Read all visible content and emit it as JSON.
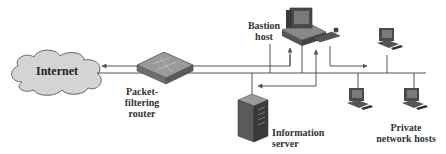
{
  "diagram": {
    "type": "network topology",
    "nodes": [
      {
        "id": "internet",
        "label": "Internet",
        "shape": "cloud"
      },
      {
        "id": "router",
        "label_lines": [
          "Packet-",
          "filtering",
          "router"
        ],
        "shape": "router"
      },
      {
        "id": "bastion",
        "label_lines": [
          "Bastion",
          "host"
        ],
        "shape": "workstation"
      },
      {
        "id": "info_server",
        "label_lines": [
          "Information",
          "server"
        ],
        "shape": "server-tower"
      },
      {
        "id": "private_hosts",
        "label_lines": [
          "Private",
          "network hosts"
        ],
        "shape": "workstation-group",
        "count": 3
      }
    ],
    "flows": [
      {
        "from": "bastion",
        "to": "internet",
        "via": "router"
      },
      {
        "from": "router",
        "to": "bastion"
      },
      {
        "from": "bastion",
        "to": "info_server"
      },
      {
        "from": "bastion",
        "to": "private_hosts"
      }
    ],
    "colors": {
      "line": "#555555",
      "cloud_fill": "#d4d4d4",
      "device_dark": "#3a3a3a",
      "device_mid": "#7a7a7a",
      "device_light": "#b8b8b8"
    }
  },
  "labels": {
    "internet": "Internet",
    "router_1": "Packet-",
    "router_2": "filtering",
    "router_3": "router",
    "bastion_1": "Bastion",
    "bastion_2": "host",
    "server_1": "Information",
    "server_2": "server",
    "private_1": "Private",
    "private_2": "network hosts"
  }
}
